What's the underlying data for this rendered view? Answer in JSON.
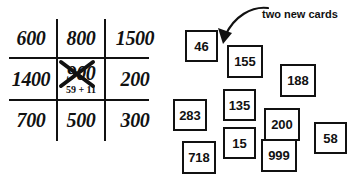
{
  "grid": {
    "rows": [
      [
        {
          "value": "600",
          "crossed_out": false
        },
        {
          "value": "800",
          "crossed_out": false
        },
        {
          "value": "1500",
          "crossed_out": false
        }
      ],
      [
        {
          "value": "1400",
          "crossed_out": false
        },
        {
          "value": "900",
          "crossed_out": true,
          "note": "59 + 11"
        },
        {
          "value": "200",
          "crossed_out": false
        }
      ],
      [
        {
          "value": "700",
          "crossed_out": false
        },
        {
          "value": "500",
          "crossed_out": false
        },
        {
          "value": "300",
          "crossed_out": false
        }
      ]
    ],
    "crossed_cell": {
      "value": "900",
      "note": "59 + 11"
    }
  },
  "cards": [
    {
      "value": "46",
      "x": 15,
      "y": 30,
      "w": 33,
      "h": 32
    },
    {
      "value": "155",
      "x": 57,
      "y": 45,
      "w": 36,
      "h": 33
    },
    {
      "value": "188",
      "x": 110,
      "y": 64,
      "w": 36,
      "h": 33
    },
    {
      "value": "135",
      "x": 53,
      "y": 89,
      "w": 33,
      "h": 32
    },
    {
      "value": "283",
      "x": 3,
      "y": 99,
      "w": 34,
      "h": 32
    },
    {
      "value": "200",
      "x": 94,
      "y": 108,
      "w": 36,
      "h": 33
    },
    {
      "value": "58",
      "x": 144,
      "y": 122,
      "w": 33,
      "h": 32
    },
    {
      "value": "15",
      "x": 53,
      "y": 127,
      "w": 33,
      "h": 32
    },
    {
      "value": "718",
      "x": 12,
      "y": 141,
      "w": 34,
      "h": 33
    },
    {
      "value": "999",
      "x": 91,
      "y": 139,
      "w": 36,
      "h": 33
    }
  ],
  "annotation": {
    "label": "two new cards",
    "arrow": "curved-arrow-down-left"
  },
  "colors": {
    "ink": "#111111",
    "background": "#ffffff"
  }
}
